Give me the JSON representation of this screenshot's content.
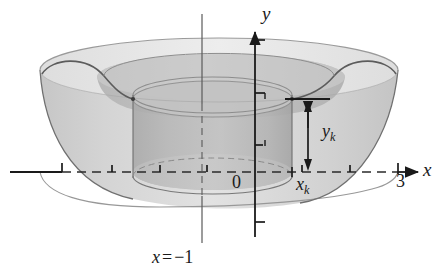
{
  "figure": {
    "kind": "solid-of-revolution-shell-diagram",
    "caption_axis": {
      "var": "x",
      "equals": "=",
      "value": "−1",
      "full": "x = −1"
    },
    "axes": {
      "x_axis_label": "x",
      "y_axis_label": "y",
      "origin_label": "0",
      "x_tick_labels": [
        "3"
      ],
      "x_tick_values": [
        3
      ],
      "x_axis_y_px": 172,
      "y_axis_x_px": 255,
      "tick_spacing_px": 47.6,
      "x_ticks_px": [
        62,
        112,
        160,
        207,
        255,
        302,
        350,
        398
      ],
      "y_ticks_px": [
        40,
        93,
        145,
        222
      ],
      "x_axis_dashed": true,
      "arrowheads": [
        "x-right",
        "y-up"
      ]
    },
    "annotations": {
      "shell_radius_label": "x",
      "shell_radius_sub": "k",
      "shell_radius_full": "xₖ",
      "shell_height_label": "y",
      "shell_height_sub": "k",
      "shell_height_full": "yₖ",
      "height_arrow": "double-headed-vertical",
      "height_top_px": 99,
      "height_bottom_px": 172
    },
    "colors": {
      "background": "#ffffff",
      "ink": "#1a1a1a",
      "outer_solid_fill": "#d8d8d8",
      "outer_solid_fill_light": "#e6e6e6",
      "outer_solid_fill_dark": "#c2c2c2",
      "shell_fill": "#b9b9b9",
      "shell_fill_dark": "#a8a8a8",
      "rim_stroke": "#8a8a8a",
      "outline_stroke": "#6f6f6f",
      "dash_stroke": "#4a4a4a"
    },
    "geometry": {
      "outer_left_px": 40,
      "outer_right_px": 398,
      "outer_top_px": 62,
      "outer_bottom_px": 206,
      "shell_left_px": 133,
      "shell_right_px": 292,
      "shell_top_px": 93,
      "shell_bottom_px": 186,
      "vertical_axis_line_px": 202
    }
  }
}
